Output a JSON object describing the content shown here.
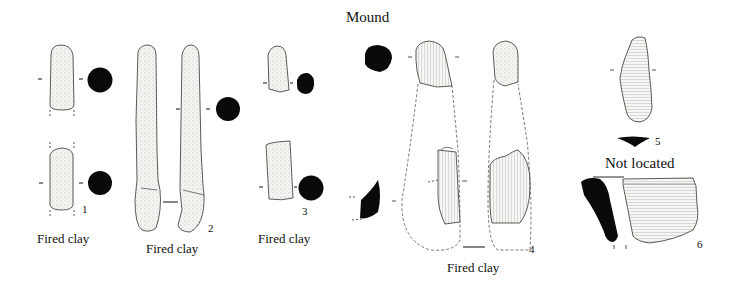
{
  "plate": {
    "section_titles": {
      "mound": "Mound",
      "not_located": "Not located"
    },
    "objects": [
      {
        "number": "1",
        "material": "Fired clay"
      },
      {
        "number": "2",
        "material": "Fired clay"
      },
      {
        "number": "3",
        "material": "Fired clay"
      },
      {
        "number": "4",
        "material": "Fired clay"
      },
      {
        "number": "5",
        "material": ""
      },
      {
        "number": "6",
        "material": ""
      }
    ]
  },
  "colors": {
    "ink": "#111111",
    "paper": "#ffffff",
    "fill": "#f4f2ee",
    "stipple": "#888888"
  }
}
